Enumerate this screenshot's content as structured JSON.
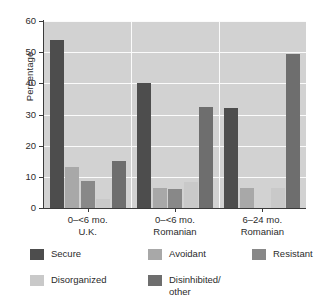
{
  "chart_data": {
    "type": "bar",
    "title": "",
    "xlabel": "",
    "ylabel": "Percentage",
    "ylim": [
      0,
      60
    ],
    "yticks": [
      0,
      10,
      20,
      30,
      40,
      50,
      60
    ],
    "ytick_labels": [
      "0",
      "10",
      "20",
      "30",
      "40",
      "50",
      "60"
    ],
    "grid": "horizontal-white",
    "legend_position": "bottom",
    "categories": [
      {
        "line1": "0–<6 mo.",
        "line2": "U.K."
      },
      {
        "line1": "0–<6 mo.",
        "line2": "Romanian"
      },
      {
        "line1": "6–24 mo.",
        "line2": "Romanian"
      }
    ],
    "category_labels": [
      "0–<6 mo. U.K.",
      "0–<6 mo. Romanian",
      "6–24 mo. Romanian"
    ],
    "series": [
      {
        "name": "Secure",
        "color": "#4d4d4d",
        "values": [
          54,
          40,
          32
        ]
      },
      {
        "name": "Avoidant",
        "color": "#a8a8a8",
        "values": [
          13,
          6.5,
          6.5
        ]
      },
      {
        "name": "Resistant",
        "color": "#888888",
        "values": [
          8.8,
          6,
          0
        ]
      },
      {
        "name": "Disorganized",
        "color": "#c9c9c9",
        "values": [
          3,
          8.5,
          6.5
        ]
      },
      {
        "name": "Disinhibited/other",
        "color": "#6e6e6e",
        "values": [
          15,
          32.5,
          49.5
        ]
      }
    ],
    "legend": [
      {
        "label": "Secure",
        "color": "#4d4d4d"
      },
      {
        "label": "Avoidant",
        "color": "#a8a8a8"
      },
      {
        "label": "Resistant",
        "color": "#888888"
      },
      {
        "label": "Disorganized",
        "color": "#c9c9c9"
      },
      {
        "label": "Disinhibited/\nother",
        "color": "#6e6e6e"
      }
    ],
    "plot_background": "#d2d2d2",
    "figure_background": "#ffffff"
  }
}
